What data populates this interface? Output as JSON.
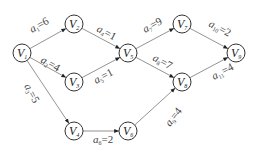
{
  "diagram": {
    "type": "directed-weighted-graph",
    "node_radius": 9,
    "colors": {
      "node_stroke": "#333333",
      "edge_stroke": "#777777",
      "text": "#222222",
      "background": "#ffffff"
    },
    "nodes": [
      {
        "id": "V1",
        "base": "V",
        "sub": "1",
        "x": 22,
        "y": 53
      },
      {
        "id": "V2",
        "base": "V",
        "sub": "2",
        "x": 74,
        "y": 24
      },
      {
        "id": "V3",
        "base": "V",
        "sub": "3",
        "x": 74,
        "y": 82
      },
      {
        "id": "V4",
        "base": "V",
        "sub": "4",
        "x": 74,
        "y": 131
      },
      {
        "id": "V5",
        "base": "V",
        "sub": "5",
        "x": 128,
        "y": 53
      },
      {
        "id": "V6",
        "base": "V",
        "sub": "6",
        "x": 128,
        "y": 131
      },
      {
        "id": "V7",
        "base": "V",
        "sub": "7",
        "x": 182,
        "y": 24
      },
      {
        "id": "V8",
        "base": "V",
        "sub": "8",
        "x": 182,
        "y": 82
      },
      {
        "id": "V9",
        "base": "V",
        "sub": "9",
        "x": 236,
        "y": 53
      }
    ],
    "edges": [
      {
        "id": "a1",
        "base": "a",
        "sub": "1",
        "value": "=6",
        "from": "V1",
        "to": "V2",
        "lx": 32,
        "ly": 33,
        "angle": -29
      },
      {
        "id": "a2",
        "base": "a",
        "sub": "2",
        "value": "=4",
        "from": "V1",
        "to": "V3",
        "lx": 40,
        "ly": 62,
        "angle": 29
      },
      {
        "id": "a3",
        "base": "a",
        "sub": "3",
        "value": "=5",
        "from": "V1",
        "to": "V4",
        "lx": 24,
        "ly": 86,
        "angle": 62
      },
      {
        "id": "a4",
        "base": "a",
        "sub": "4",
        "value": "=1",
        "from": "V2",
        "to": "V5",
        "lx": 96,
        "ly": 31,
        "angle": 28
      },
      {
        "id": "a5",
        "base": "a",
        "sub": "5",
        "value": "=1",
        "from": "V3",
        "to": "V5",
        "lx": 96,
        "ly": 84,
        "angle": -28
      },
      {
        "id": "a6",
        "base": "a",
        "sub": "6",
        "value": "=2",
        "from": "V4",
        "to": "V6",
        "lx": 93,
        "ly": 143,
        "angle": 0
      },
      {
        "id": "a7",
        "base": "a",
        "sub": "7",
        "value": "=9",
        "from": "V5",
        "to": "V7",
        "lx": 145,
        "ly": 33,
        "angle": -28
      },
      {
        "id": "a8",
        "base": "a",
        "sub": "8",
        "value": "=7",
        "from": "V5",
        "to": "V8",
        "lx": 152,
        "ly": 60,
        "angle": 28
      },
      {
        "id": "a9",
        "base": "a",
        "sub": "9",
        "value": "=4",
        "from": "V6",
        "to": "V8",
        "lx": 170,
        "ly": 127,
        "angle": -52
      },
      {
        "id": "a10",
        "base": "a",
        "sub": "10",
        "value": "=2",
        "from": "V7",
        "to": "V9",
        "lx": 208,
        "ly": 26,
        "angle": 28
      },
      {
        "id": "a11",
        "base": "a",
        "sub": "11",
        "value": "=4",
        "from": "V8",
        "to": "V9",
        "lx": 214,
        "ly": 80,
        "angle": -28
      }
    ]
  }
}
